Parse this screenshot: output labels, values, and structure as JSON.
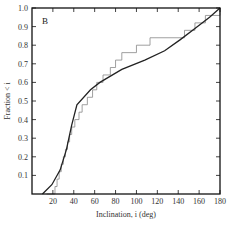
{
  "chart_data": {
    "type": "line",
    "title": "",
    "panel_label": "B",
    "xlabel": "Inclination, i (deg)",
    "ylabel": "Fraction < i",
    "xlim": [
      0,
      180
    ],
    "ylim": [
      0,
      1.0
    ],
    "x_ticks": [
      20,
      40,
      60,
      80,
      100,
      120,
      140,
      160,
      180
    ],
    "y_ticks": [
      0.1,
      0.2,
      0.3,
      0.4,
      0.5,
      0.6,
      0.7,
      0.8,
      0.9,
      1.0
    ],
    "grid": false,
    "legend": null,
    "series": [
      {
        "name": "observed (step CDF)",
        "style": "step",
        "color": "#888888",
        "x": [
          14,
          22,
          24,
          26,
          28,
          30,
          32,
          34,
          36,
          38,
          41,
          45,
          48,
          53,
          58,
          62,
          68,
          75,
          80,
          86,
          100,
          113,
          146,
          156,
          166,
          180
        ],
        "y": [
          0.0,
          0.04,
          0.08,
          0.12,
          0.16,
          0.2,
          0.24,
          0.28,
          0.32,
          0.36,
          0.4,
          0.44,
          0.48,
          0.52,
          0.56,
          0.6,
          0.64,
          0.68,
          0.72,
          0.76,
          0.8,
          0.84,
          0.88,
          0.92,
          0.96,
          1.0
        ]
      },
      {
        "name": "model (smooth CDF)",
        "style": "line",
        "color": "#222222",
        "x": [
          10,
          19,
          27,
          33,
          38,
          43,
          56,
          65,
          86,
          108,
          127,
          142,
          156,
          170,
          180
        ],
        "y": [
          0.0,
          0.05,
          0.13,
          0.24,
          0.37,
          0.48,
          0.56,
          0.6,
          0.67,
          0.72,
          0.77,
          0.83,
          0.89,
          0.95,
          1.0
        ]
      }
    ]
  }
}
